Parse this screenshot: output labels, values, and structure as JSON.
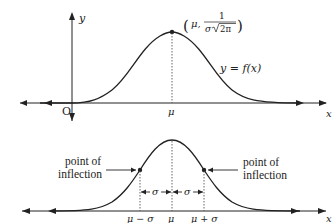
{
  "top_graph": {
    "y_axis_label": "y",
    "x_axis_label": "x",
    "origin_label": "O",
    "mean_label": "μ",
    "peak_point_label": {
      "open": "(",
      "mu": "μ,",
      "numerator": "1",
      "denominator_sigma": "σ",
      "denominator_root": "2π",
      "close": ")"
    },
    "curve_label": "y = f(x)"
  },
  "bottom_graph": {
    "x_axis_label": "x",
    "left_annotation": [
      "point of",
      "inflection"
    ],
    "right_annotation": [
      "point of",
      "inflection"
    ],
    "sigma_left": "σ",
    "sigma_right": "σ",
    "tick_labels": [
      "μ − σ",
      "μ",
      "μ + σ"
    ]
  },
  "colors": {
    "line": "#222222",
    "dotted": "#555555"
  }
}
